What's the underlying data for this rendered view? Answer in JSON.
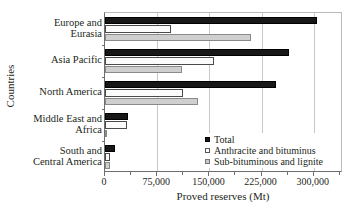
{
  "chart_data": {
    "type": "bar",
    "orientation": "horizontal",
    "title": "",
    "xlabel": "Proved reserves (Mt)",
    "ylabel": "Countries",
    "xlim": [
      0,
      342000
    ],
    "xticks": [
      0,
      75000,
      150000,
      225000,
      300000
    ],
    "xtick_labels": [
      "0",
      "75,000",
      "150,000",
      "225,000",
      "300,000"
    ],
    "grid": "vertical",
    "legend_position": "lower-right-inside",
    "categories": [
      "Europe and Eurasia",
      "Asia Pacific",
      "North America",
      "Middle East and Africa",
      "South and Central America"
    ],
    "category_lines": [
      [
        "Europe and",
        "Eurasia"
      ],
      [
        "Asia Pacific"
      ],
      [
        "North America"
      ],
      [
        "Middle East and",
        "Africa"
      ],
      [
        "South and",
        "Central America"
      ]
    ],
    "series": [
      {
        "name": "Total",
        "color": "#171717",
        "values": [
          304000,
          265000,
          246000,
          33000,
          14000
        ]
      },
      {
        "name": "Anthracite and bituminus",
        "color": "#fbfbfb",
        "values": [
          95000,
          157000,
          112000,
          32000,
          7000
        ]
      },
      {
        "name": "Sub-bituminous and lignite",
        "color": "#cfcfcf",
        "values": [
          210000,
          110000,
          133000,
          500,
          7000
        ]
      }
    ]
  },
  "legend": {
    "items": [
      {
        "label": "Total",
        "swatch": "black-filled-square"
      },
      {
        "label": "Anthracite and bituminus",
        "swatch": "white-outlined-square"
      },
      {
        "label": "Sub-bituminous and lignite",
        "swatch": "gray-filled-square"
      }
    ]
  }
}
